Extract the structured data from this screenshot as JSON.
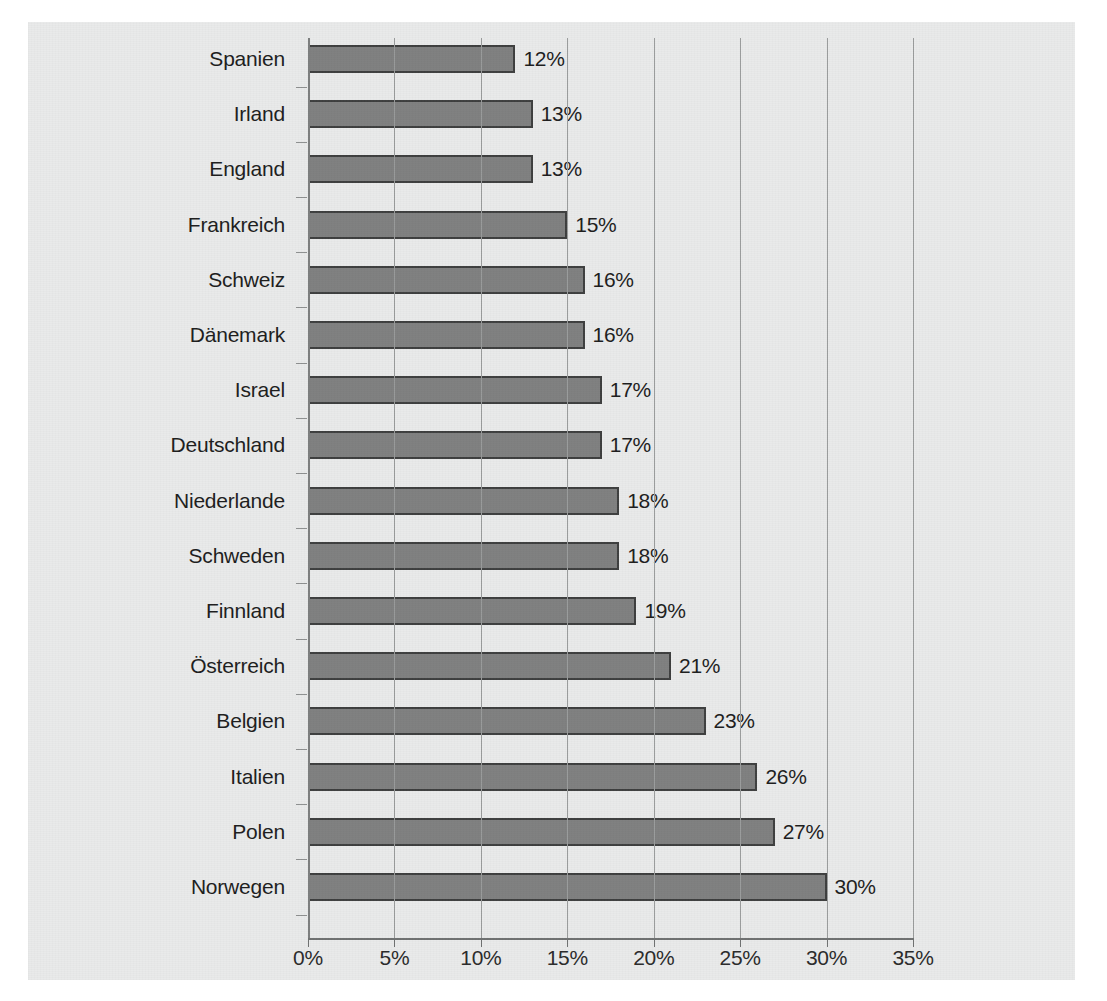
{
  "chart_data": {
    "type": "bar",
    "orientation": "horizontal",
    "title": "",
    "subtitle": "",
    "xlabel": "",
    "ylabel": "",
    "xlim": [
      0,
      35
    ],
    "xtick_labels": [
      "0%",
      "5%",
      "10%",
      "15%",
      "20%",
      "25%",
      "30%",
      "35%"
    ],
    "xticks": [
      0,
      5,
      10,
      15,
      20,
      25,
      30,
      35
    ],
    "grid": "vertical",
    "legend": "none",
    "value_label_suffix": "%",
    "categories": [
      "Spanien",
      "Irland",
      "England",
      "Frankreich",
      "Schweiz",
      "Dänemark",
      "Israel",
      "Deutschland",
      "Niederlande",
      "Schweden",
      "Finnland",
      "Österreich",
      "Belgien",
      "Italien",
      "Polen",
      "Norwegen"
    ],
    "values": [
      12,
      13,
      13,
      15,
      16,
      16,
      17,
      17,
      18,
      18,
      19,
      21,
      23,
      26,
      27,
      30
    ],
    "value_labels": [
      "12%",
      "13%",
      "13%",
      "15%",
      "16%",
      "16%",
      "17%",
      "17%",
      "18%",
      "18%",
      "19%",
      "21%",
      "23%",
      "26%",
      "27%",
      "30%"
    ],
    "colors": {
      "bar_fill": "#7f8080",
      "bar_border": "#3e3f3f",
      "panel_background": "#e9eaea",
      "gridline": "#9a9c9c",
      "axis": "#6f7171",
      "text": "#1d1d1d"
    }
  }
}
